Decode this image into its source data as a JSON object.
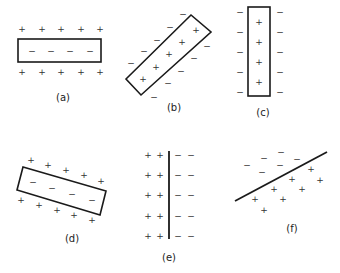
{
  "figure": {
    "panels": [
      {
        "id": "a",
        "label": "(a)",
        "shape": "rectangle-horizontal",
        "inside": "−",
        "outside": "+"
      },
      {
        "id": "b",
        "label": "(b)",
        "shape": "rectangle-tilted",
        "inside": "+",
        "outside": "−"
      },
      {
        "id": "c",
        "label": "(c)",
        "shape": "rectangle-vertical",
        "inside": "+",
        "outside": "−"
      },
      {
        "id": "d",
        "label": "(d)",
        "shape": "rectangle-tilted",
        "inside": "−",
        "outside": "+"
      },
      {
        "id": "e",
        "label": "(e)",
        "shape": "vertical-line",
        "left": "+",
        "right": "−"
      },
      {
        "id": "f",
        "label": "(f)",
        "shape": "diagonal-line",
        "above": "−",
        "below": "+"
      }
    ],
    "plus": "+",
    "minus": "−"
  }
}
